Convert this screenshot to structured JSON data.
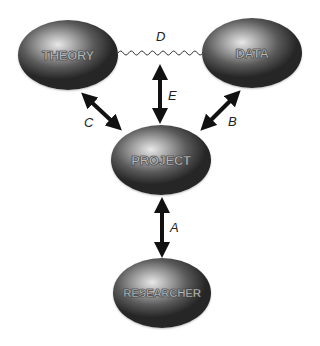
{
  "diagram": {
    "nodes": [
      {
        "id": "theory",
        "label": "THEORY"
      },
      {
        "id": "data",
        "label": "DATA"
      },
      {
        "id": "project",
        "label": "PROJECT"
      },
      {
        "id": "researcher",
        "label": "RESEARCHER"
      }
    ],
    "edges": [
      {
        "id": "A",
        "label": "A",
        "from": "researcher",
        "to": "project",
        "style": "double-arrow"
      },
      {
        "id": "B",
        "label": "B",
        "from": "data",
        "to": "project",
        "style": "double-arrow"
      },
      {
        "id": "C",
        "label": "C",
        "from": "theory",
        "to": "project",
        "style": "double-arrow"
      },
      {
        "id": "D",
        "label": "D",
        "from": "theory",
        "to": "data",
        "style": "wavy-line"
      },
      {
        "id": "E",
        "label": "E",
        "from": "theory-data-link",
        "to": "project",
        "style": "double-arrow"
      }
    ]
  }
}
